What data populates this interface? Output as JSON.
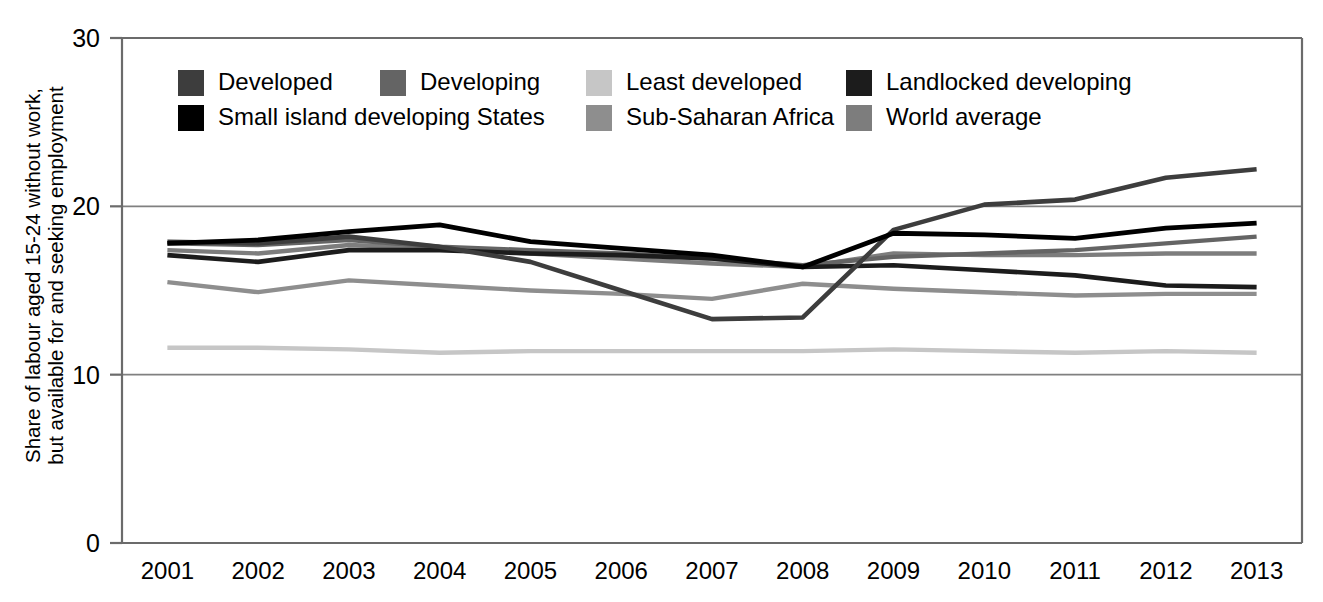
{
  "chart_data": {
    "type": "line",
    "title": "",
    "xlabel": "",
    "ylabel": "Share of labour aged 15-24 without work, but available for and seeking employment",
    "ylabel_line1": "Share of labour aged 15-24 without work,",
    "ylabel_line2": "but available for and seeking employment",
    "categories": [
      "2001",
      "2002",
      "2003",
      "2004",
      "2005",
      "2006",
      "2007",
      "2008",
      "2009",
      "2010",
      "2011",
      "2012",
      "2013"
    ],
    "x": [
      2001,
      2002,
      2003,
      2004,
      2005,
      2006,
      2007,
      2008,
      2009,
      2010,
      2011,
      2012,
      2013
    ],
    "ylim": [
      0,
      30
    ],
    "yticks": [
      0,
      10,
      20,
      30
    ],
    "ytick_labels": [
      "0",
      "10",
      "20",
      "30"
    ],
    "grid": true,
    "grid_axis": "y",
    "legend_position": "top-inside",
    "series": [
      {
        "name": "Developed",
        "color": "#3d3d3d",
        "width": 4.6,
        "values": [
          17.9,
          17.8,
          18.2,
          17.6,
          16.7,
          15.0,
          13.3,
          13.4,
          18.6,
          20.1,
          20.4,
          21.7,
          22.2
        ]
      },
      {
        "name": "Developing",
        "color": "#646464",
        "width": 4.4,
        "values": [
          17.8,
          17.7,
          18.0,
          17.6,
          17.4,
          17.2,
          16.9,
          16.5,
          17.0,
          17.2,
          17.4,
          17.8,
          18.2
        ]
      },
      {
        "name": "Least developed",
        "color": "#c6c6c6",
        "width": 4.4,
        "values": [
          11.6,
          11.6,
          11.5,
          11.3,
          11.4,
          11.4,
          11.4,
          11.4,
          11.5,
          11.4,
          11.3,
          11.4,
          11.3
        ]
      },
      {
        "name": "Landlocked developing",
        "color": "#1c1c1c",
        "width": 4.6,
        "values": [
          17.1,
          16.7,
          17.4,
          17.4,
          17.2,
          17.1,
          16.9,
          16.4,
          16.5,
          16.2,
          15.9,
          15.3,
          15.2
        ]
      },
      {
        "name": "Small island developing States",
        "color": "#000000",
        "width": 4.8,
        "values": [
          17.8,
          18.0,
          18.5,
          18.9,
          17.9,
          17.5,
          17.1,
          16.4,
          18.4,
          18.3,
          18.1,
          18.7,
          19.0
        ]
      },
      {
        "name": "Sub-Saharan Africa",
        "color": "#8e8e8e",
        "width": 4.4,
        "values": [
          15.5,
          14.9,
          15.6,
          15.3,
          15.0,
          14.8,
          14.5,
          15.4,
          15.1,
          14.9,
          14.7,
          14.8,
          14.8
        ]
      },
      {
        "name": "World average",
        "color": "#7d7d7d",
        "width": 4.4,
        "values": [
          17.4,
          17.2,
          17.7,
          17.5,
          17.2,
          16.9,
          16.6,
          16.4,
          17.2,
          17.1,
          17.1,
          17.2,
          17.2
        ]
      }
    ],
    "legend_rows": [
      [
        {
          "label": "Developed",
          "color": "#3d3d3d"
        },
        {
          "label": "Developing",
          "color": "#646464"
        },
        {
          "label": "Least developed",
          "color": "#c6c6c6"
        },
        {
          "label": "Landlocked developing",
          "color": "#1c1c1c"
        }
      ],
      [
        {
          "label": "Small island developing States",
          "color": "#000000"
        },
        {
          "label": "Sub-Saharan Africa",
          "color": "#8e8e8e"
        },
        {
          "label": "World average",
          "color": "#7d7d7d"
        }
      ]
    ]
  }
}
